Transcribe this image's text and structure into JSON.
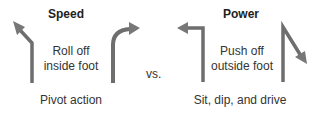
{
  "left": {
    "title": "Speed",
    "description_line1": "Roll off",
    "description_line2": "inside foot",
    "caption": "Pivot action",
    "arrows": [
      "diagonal-up-left-arrow",
      "curved-up-right-arrow"
    ]
  },
  "separator": "vs.",
  "right": {
    "title": "Power",
    "description_line1": "Push off",
    "description_line2": "outside foot",
    "caption": "Sit, dip, and drive",
    "arrows": [
      "sharp-left-arrow",
      "sharp-down-right-arrow"
    ]
  },
  "colors": {
    "arrow": "#777777",
    "arrow_dark": "#555555",
    "text": "#333333"
  }
}
